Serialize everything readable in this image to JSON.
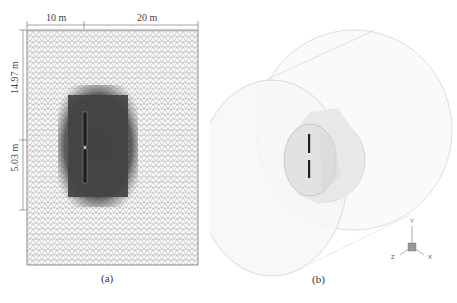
{
  "figure": {
    "panels": [
      {
        "id": "a",
        "caption": "(a)",
        "description": "2D triangular mesh of computational domain with refined region around turbine",
        "dimensions": {
          "top_left_width": "10 m",
          "top_right_width": "20 m",
          "left_upper_height": "14.97 m",
          "left_lower_height": "5.03 m"
        }
      },
      {
        "id": "b",
        "caption": "(b)",
        "description": "3D cylindrical computational domain with inner rotating cylinder containing turbine blades",
        "axes": {
          "y": "Y",
          "z": "Z",
          "x": "X"
        }
      }
    ],
    "colors": {
      "mesh_line": "#9a9a9a",
      "refined_region": "#3a3a3a",
      "domain_outline": "#cfcfcf",
      "inner_cylinder": "#e0e0e0",
      "blade": "#222222"
    }
  }
}
